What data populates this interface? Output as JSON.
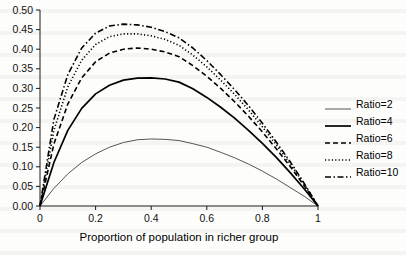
{
  "chart_data": {
    "type": "line",
    "title": "",
    "xlabel": "Proportion of population in richer group",
    "ylabel": "",
    "xlim": [
      0,
      1
    ],
    "ylim": [
      0,
      0.5
    ],
    "grid": false,
    "legend_position": "right",
    "x_ticks": [
      "0",
      "0.2",
      "0.4",
      "0.6",
      "0.8",
      "1"
    ],
    "x_tick_values": [
      0,
      0.2,
      0.4,
      0.6,
      0.8,
      1
    ],
    "y_ticks": [
      "0.00",
      "0.05",
      "0.10",
      "0.15",
      "0.20",
      "0.25",
      "0.30",
      "0.35",
      "0.40",
      "0.45",
      "0.50"
    ],
    "y_tick_values": [
      0,
      0.05,
      0.1,
      0.15,
      0.2,
      0.25,
      0.3,
      0.35,
      0.4,
      0.45,
      0.5
    ],
    "x": [
      0,
      0.05,
      0.1,
      0.15,
      0.2,
      0.25,
      0.3,
      0.35,
      0.4,
      0.45,
      0.5,
      0.55,
      0.6,
      0.65,
      0.7,
      0.75,
      0.8,
      0.85,
      0.9,
      0.95,
      1
    ],
    "series": [
      {
        "name": "Ratio=2",
        "ratio": 2,
        "style": "solid-thin",
        "color": "#555555",
        "width": 1,
        "peak_x": 0.5,
        "peak_y": 0.26,
        "values": [
          0,
          0.045,
          0.082,
          0.111,
          0.133,
          0.15,
          0.162,
          0.169,
          0.171,
          0.17,
          0.167,
          0.159,
          0.15,
          0.137,
          0.123,
          0.107,
          0.089,
          0.069,
          0.047,
          0.025,
          0
        ]
      },
      {
        "name": "Ratio=4",
        "ratio": 4,
        "style": "solid-thick",
        "color": "#000000",
        "width": 1.7,
        "peak_x": 0.5,
        "peak_y": 0.375,
        "values": [
          0,
          0.111,
          0.193,
          0.249,
          0.286,
          0.308,
          0.321,
          0.326,
          0.327,
          0.324,
          0.316,
          0.299,
          0.277,
          0.252,
          0.224,
          0.193,
          0.16,
          0.124,
          0.085,
          0.044,
          0
        ]
      },
      {
        "name": "Ratio=6",
        "ratio": 6,
        "style": "dashed",
        "color": "#000000",
        "width": 1.6,
        "peak_x": 0.5,
        "peak_y": 0.425,
        "values": [
          0,
          0.158,
          0.26,
          0.327,
          0.368,
          0.39,
          0.4,
          0.403,
          0.4,
          0.393,
          0.381,
          0.358,
          0.331,
          0.3,
          0.266,
          0.229,
          0.189,
          0.146,
          0.101,
          0.052,
          0
        ]
      },
      {
        "name": "Ratio=8",
        "ratio": 8,
        "style": "dotted",
        "color": "#000000",
        "width": 1.6,
        "peak_x": 0.5,
        "peak_y": 0.44,
        "values": [
          0,
          0.193,
          0.304,
          0.372,
          0.412,
          0.432,
          0.439,
          0.439,
          0.434,
          0.425,
          0.41,
          0.385,
          0.355,
          0.321,
          0.285,
          0.245,
          0.202,
          0.156,
          0.108,
          0.056,
          0
        ]
      },
      {
        "name": "Ratio=10",
        "ratio": 10,
        "style": "dashdot",
        "color": "#000000",
        "width": 1.6,
        "peak_x": 0.5,
        "peak_y": 0.452,
        "values": [
          0,
          0.221,
          0.335,
          0.403,
          0.441,
          0.459,
          0.464,
          0.462,
          0.456,
          0.445,
          0.429,
          0.403,
          0.371,
          0.335,
          0.297,
          0.256,
          0.211,
          0.163,
          0.113,
          0.058,
          0
        ]
      }
    ]
  },
  "legend": {
    "items": [
      {
        "label": "Ratio=2"
      },
      {
        "label": "Ratio=4"
      },
      {
        "label": "Ratio=6"
      },
      {
        "label": "Ratio=8"
      },
      {
        "label": "Ratio=10"
      }
    ]
  },
  "axes": {
    "x_title": "Proportion of population in richer group"
  }
}
